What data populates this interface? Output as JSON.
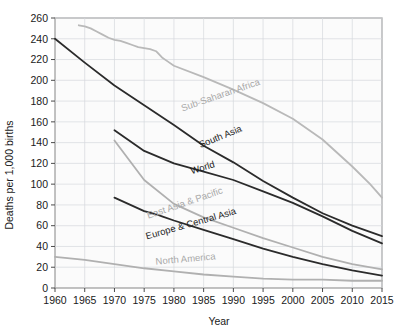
{
  "chart_data": {
    "type": "line",
    "title": "",
    "xlabel": "Year",
    "ylabel": "Deaths per 1,000 births",
    "xlim": [
      1960,
      2015
    ],
    "ylim": [
      0,
      260
    ],
    "xticks": [
      1960,
      1965,
      1970,
      1975,
      1980,
      1985,
      1990,
      1995,
      2000,
      2005,
      2010,
      2015
    ],
    "yticks": [
      0,
      20,
      40,
      60,
      80,
      100,
      120,
      140,
      160,
      180,
      200,
      220,
      240,
      260
    ],
    "grid": true,
    "legend_position": "inline-labels",
    "series": [
      {
        "name": "Sub-Saharan Africa",
        "color": "#b9b9b9",
        "label_anchor": {
          "x": 1988,
          "y": 183
        },
        "label_rotation": -19,
        "x": [
          1964,
          1965,
          1966,
          1967,
          1968,
          1969,
          1970,
          1971,
          1972,
          1973,
          1974,
          1975,
          1976,
          1977,
          1978,
          1979,
          1980,
          1985,
          1990,
          1995,
          2000,
          2005,
          2010,
          2013,
          2015
        ],
        "values": [
          253,
          252,
          250,
          247,
          244,
          241,
          239,
          238,
          236,
          234,
          232,
          231,
          230,
          228,
          222,
          218,
          214,
          203,
          191,
          178,
          163,
          143,
          117,
          100,
          87
        ]
      },
      {
        "name": "South Asia",
        "color": "#2b2b2b",
        "label_anchor": {
          "x": 1988,
          "y": 143
        },
        "label_rotation": -22,
        "x": [
          1960,
          1965,
          1970,
          1975,
          1980,
          1985,
          1990,
          1995,
          2000,
          2005,
          2010,
          2015
        ],
        "values": [
          240,
          217,
          195,
          176,
          157,
          137,
          121,
          103,
          87,
          72,
          60,
          50
        ]
      },
      {
        "name": "World",
        "color": "#2b2b2b",
        "label_anchor": {
          "x": 1985,
          "y": 113
        },
        "label_rotation": -17,
        "x": [
          1970,
          1975,
          1980,
          1985,
          1990,
          1995,
          2000,
          2005,
          2010,
          2015
        ],
        "values": [
          152,
          132,
          120,
          112,
          104,
          93,
          82,
          69,
          55,
          43
        ]
      },
      {
        "name": "East Asia & Pacific",
        "color": "#b0b0b0",
        "label_anchor": {
          "x": 1982,
          "y": 79
        },
        "label_rotation": -19,
        "x": [
          1970,
          1975,
          1980,
          1985,
          1990,
          1995,
          2000,
          2005,
          2010,
          2015
        ],
        "values": [
          142,
          104,
          81,
          68,
          58,
          48,
          39,
          30,
          23,
          18
        ]
      },
      {
        "name": "Europe & Central Asia",
        "color": "#2b2b2b",
        "label_anchor": {
          "x": 1983,
          "y": 59
        },
        "label_rotation": -16,
        "x": [
          1970,
          1975,
          1977,
          1978,
          1980,
          1985,
          1990,
          1995,
          2000,
          2005,
          2010,
          2015
        ],
        "values": [
          87,
          74,
          71,
          69,
          65,
          56,
          47,
          38,
          30,
          23,
          17,
          12
        ]
      },
      {
        "name": "North America",
        "color": "#b0b0b0",
        "label_anchor": {
          "x": 1982,
          "y": 25
        },
        "label_rotation": -5,
        "x": [
          1960,
          1965,
          1970,
          1975,
          1980,
          1985,
          1990,
          1995,
          2000,
          2005,
          2010,
          2015
        ],
        "values": [
          30,
          27,
          23,
          19,
          16,
          13,
          11,
          9,
          8,
          8,
          7,
          7
        ]
      }
    ]
  }
}
